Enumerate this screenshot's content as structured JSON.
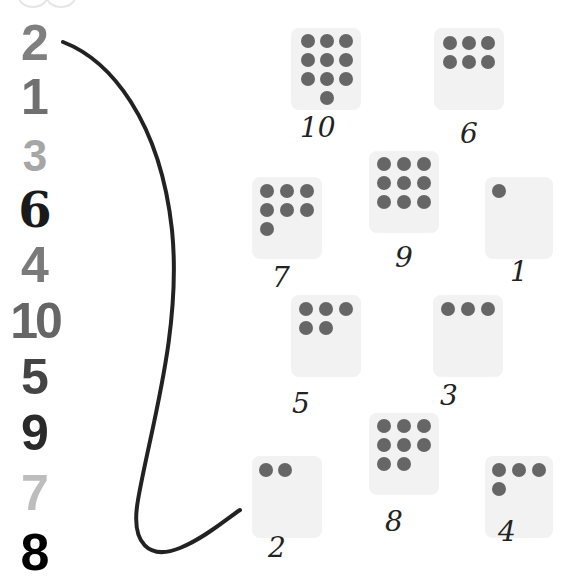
{
  "worksheet": {
    "left_numbers": [
      {
        "value": "2",
        "color": "#7f7f7f"
      },
      {
        "value": "1",
        "color": "#707070"
      },
      {
        "value": "3",
        "color": "#a6a6a6"
      },
      {
        "value": "6",
        "color": "#1a1a1a"
      },
      {
        "value": "4",
        "color": "#7a7a7a"
      },
      {
        "value": "10",
        "color": "#666666"
      },
      {
        "value": "5",
        "color": "#444444"
      },
      {
        "value": "9",
        "color": "#2a2a2a"
      },
      {
        "value": "7",
        "color": "#bdbdbd"
      },
      {
        "value": "8",
        "color": "#000000"
      }
    ],
    "cards": [
      {
        "dots": 10,
        "handwritten_label": "10"
      },
      {
        "dots": 6,
        "handwritten_label": "6"
      },
      {
        "dots": 7,
        "handwritten_label": "7"
      },
      {
        "dots": 9,
        "handwritten_label": "9"
      },
      {
        "dots": 1,
        "handwritten_label": "1"
      },
      {
        "dots": 5,
        "handwritten_label": "5"
      },
      {
        "dots": 3,
        "handwritten_label": "3"
      },
      {
        "dots": 8,
        "handwritten_label": "8"
      },
      {
        "dots": 2,
        "handwritten_label": "2"
      },
      {
        "dots": 4,
        "handwritten_label": "4"
      }
    ],
    "connection": {
      "from_number": "2",
      "to_card_dots": 2
    },
    "colors": {
      "dot": "#666666",
      "card": "#f2f2f2",
      "ink": "#222222"
    }
  }
}
